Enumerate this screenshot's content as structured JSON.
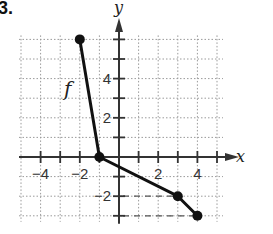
{
  "problem_number": "3.",
  "chart_data": {
    "type": "line",
    "title": "",
    "function_label": "f",
    "xlabel": "x",
    "ylabel": "y",
    "x_ticks_labeled": [
      -4,
      -2,
      2,
      4
    ],
    "y_ticks_labeled": [
      -2,
      2,
      4
    ],
    "tick_labels": {
      "x": [
        "−4",
        "−2",
        "2",
        "4"
      ],
      "y": [
        "−2",
        "2",
        "4"
      ]
    },
    "xlim": [
      -5,
      5
    ],
    "ylim": [
      -3,
      6
    ],
    "grid": true,
    "grid_style": "dotted",
    "series": [
      {
        "name": "f",
        "points": [
          [
            -2,
            6
          ],
          [
            -1,
            0
          ],
          [
            3,
            -2
          ],
          [
            4,
            -3
          ]
        ],
        "endpoints_closed": true
      }
    ],
    "guides": [
      {
        "from": [
          0,
          -2
        ],
        "to": [
          3,
          -2
        ],
        "style": "dashed"
      },
      {
        "from": [
          0,
          -3
        ],
        "to": [
          4,
          -3
        ],
        "style": "dashed"
      }
    ]
  },
  "colors": {
    "grid": "#9a9a9a",
    "axis": "#333333",
    "curve": "#111111"
  }
}
